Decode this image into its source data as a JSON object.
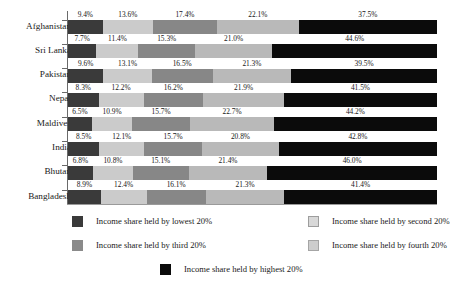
{
  "chart_data": {
    "type": "bar",
    "subtype": "stacked-horizontal-100pct",
    "title": "",
    "xlabel": "",
    "ylabel": "",
    "xlim": [
      0,
      100
    ],
    "grid": false,
    "orientation": "horizontal",
    "stacked": true,
    "value_suffix": "%",
    "legend_position": "bottom",
    "categories": [
      "Afghanistan",
      "Sri Lanka",
      "Pakistan",
      "Nepal",
      "Maldives",
      "India",
      "Bhutan",
      "Bangladesh"
    ],
    "series": [
      {
        "name": "Income share held by lowest 20%",
        "color": "#3a3a3a",
        "values": [
          9.4,
          7.7,
          9.6,
          8.3,
          6.5,
          8.5,
          6.8,
          8.9
        ],
        "labels": [
          "9.4%",
          "7.7%",
          "9.6%",
          "8.3%",
          "6.5%",
          "8.5%",
          "6.8%",
          "8.9%"
        ]
      },
      {
        "name": "Income share held by second 20%",
        "color": "#cbcbcb",
        "values": [
          13.6,
          11.4,
          13.1,
          12.2,
          10.9,
          12.1,
          10.8,
          12.4
        ],
        "labels": [
          "13.6%",
          "11.4%",
          "13.1%",
          "12.2%",
          "10.9%",
          "12.1%",
          "10.8%",
          "12.4%"
        ]
      },
      {
        "name": "Income share held by third 20%",
        "color": "#878787",
        "values": [
          17.4,
          15.3,
          16.5,
          16.2,
          15.7,
          15.7,
          15.1,
          16.1
        ],
        "labels": [
          "17.4%",
          "15.3%",
          "16.5%",
          "16.2%",
          "15.7%",
          "15.7%",
          "15.1%",
          "16.1%"
        ]
      },
      {
        "name": "Income share held by fourth 20%",
        "color": "#b9b9b9",
        "values": [
          22.1,
          21.0,
          21.3,
          21.9,
          22.7,
          20.8,
          21.4,
          21.3
        ],
        "labels": [
          "22.1%",
          "21.0%",
          "21.3%",
          "21.9%",
          "22.7%",
          "20.8%",
          "21.4%",
          "21.3%"
        ]
      },
      {
        "name": "Income share held by highest 20%",
        "color": "#0b0b0b",
        "values": [
          37.5,
          44.6,
          39.5,
          41.5,
          44.2,
          42.8,
          46.0,
          41.4
        ],
        "labels": [
          "37.5%",
          "44.6%",
          "39.5%",
          "41.5%",
          "44.2%",
          "42.8%",
          "46.0%",
          "41.4%"
        ]
      }
    ]
  },
  "legend": {
    "items": [
      {
        "label": "Income share held by lowest 20%",
        "swatch": "s1"
      },
      {
        "label": "Income share held by second 20%",
        "swatch": "s2"
      },
      {
        "label": "Income share held by third 20%",
        "swatch": "s3"
      },
      {
        "label": "Income share held by fourth 20%",
        "swatch": "s4"
      },
      {
        "label": "Income share held by highest 20%",
        "swatch": "s5"
      }
    ]
  }
}
